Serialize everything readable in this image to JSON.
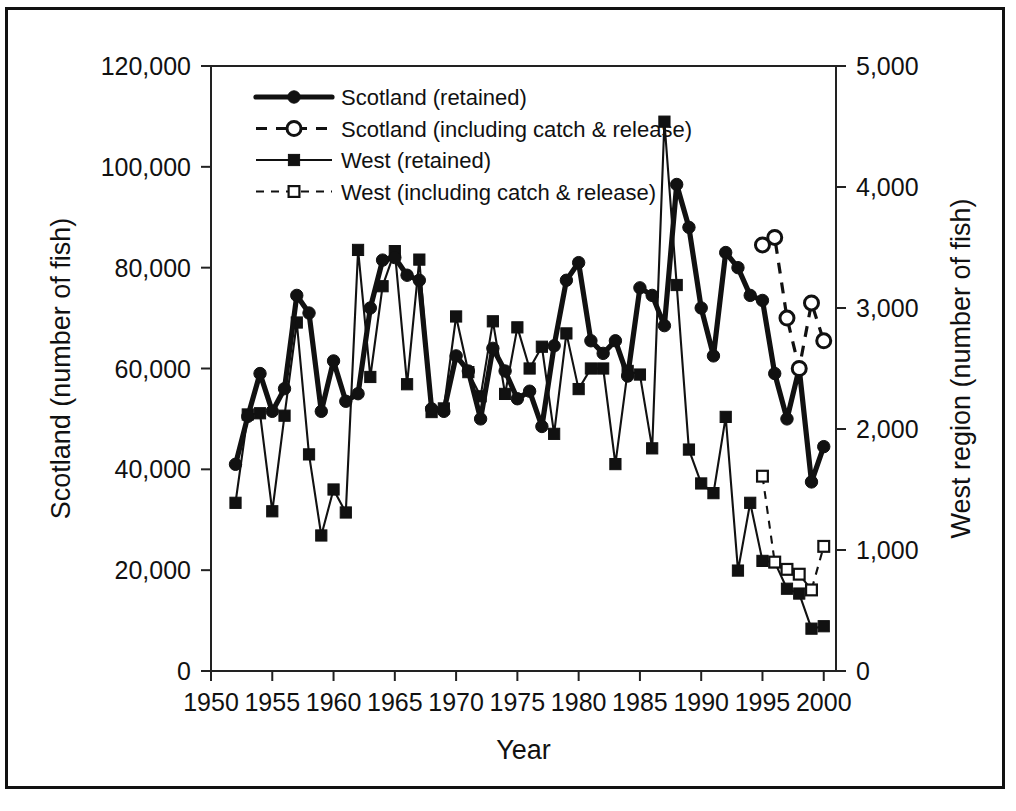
{
  "chart_data": {
    "type": "line",
    "title": "",
    "xlabel": "Year",
    "ylabel": "Scotland (number of fish)",
    "y2label": "West region (number of fish)",
    "xlim": [
      1950,
      2001
    ],
    "ylim": [
      0,
      120000
    ],
    "y2lim": [
      0,
      5000
    ],
    "xticks": [
      1950,
      1955,
      1960,
      1965,
      1970,
      1975,
      1980,
      1985,
      1990,
      1995,
      2000
    ],
    "xtick_labels": [
      "1950",
      "1955",
      "1960",
      "1965",
      "1970",
      "1975",
      "1980",
      "1985",
      "1990",
      "1995",
      "2000"
    ],
    "yticks": [
      0,
      20000,
      40000,
      60000,
      80000,
      100000,
      120000
    ],
    "ytick_labels": [
      "0",
      "20,000",
      "40,000",
      "60,000",
      "80,000",
      "100,000",
      "120,000"
    ],
    "y2ticks": [
      0,
      1000,
      2000,
      3000,
      4000,
      5000
    ],
    "y2tick_labels": [
      "0",
      "1,000",
      "2,000",
      "3,000",
      "4,000",
      "5,000"
    ],
    "grid": false,
    "legend_position": "upper-left-inside",
    "series": [
      {
        "name": "Scotland (retained)",
        "axis": "left",
        "marker": "filled-circle",
        "linestyle": "solid-thick",
        "x": [
          1952,
          1953,
          1954,
          1955,
          1956,
          1957,
          1958,
          1959,
          1960,
          1961,
          1962,
          1963,
          1964,
          1965,
          1966,
          1967,
          1968,
          1969,
          1970,
          1971,
          1972,
          1973,
          1974,
          1975,
          1976,
          1977,
          1978,
          1979,
          1980,
          1981,
          1982,
          1983,
          1984,
          1985,
          1986,
          1987,
          1988,
          1989,
          1990,
          1991,
          1992,
          1993,
          1994,
          1995,
          1996,
          1997,
          1998,
          1999,
          2000
        ],
        "values": [
          41000,
          50500,
          59000,
          51500,
          56000,
          74500,
          71000,
          51500,
          61500,
          53500,
          55000,
          72000,
          81500,
          82000,
          78500,
          77500,
          52000,
          51500,
          62500,
          59500,
          50000,
          64000,
          59500,
          54000,
          55500,
          48500,
          64500,
          77500,
          81000,
          65500,
          63000,
          65500,
          58500,
          76000,
          74500,
          68500,
          96500,
          88000,
          72000,
          62500,
          83000,
          80000,
          74500,
          73500,
          59000,
          50000,
          60000,
          37500,
          44500
        ]
      },
      {
        "name": "Scotland (including catch & release)",
        "axis": "left",
        "marker": "open-circle",
        "linestyle": "dashed",
        "x": [
          1995,
          1996,
          1997,
          1998,
          1999,
          2000
        ],
        "values": [
          84500,
          86000,
          70000,
          60000,
          73000,
          65500
        ]
      },
      {
        "name": "West (retained)",
        "axis": "right",
        "marker": "filled-square",
        "linestyle": "solid-thin",
        "x": [
          1952,
          1953,
          1954,
          1955,
          1956,
          1957,
          1958,
          1959,
          1960,
          1961,
          1962,
          1963,
          1964,
          1965,
          1966,
          1967,
          1968,
          1969,
          1970,
          1971,
          1972,
          1973,
          1974,
          1975,
          1976,
          1977,
          1978,
          1979,
          1980,
          1981,
          1982,
          1983,
          1984,
          1985,
          1986,
          1987,
          1988,
          1989,
          1990,
          1991,
          1992,
          1993,
          1994,
          1995,
          1996,
          1997,
          1998,
          1999,
          2000
        ],
        "values": [
          1390,
          2120,
          2130,
          1320,
          2110,
          2880,
          1790,
          1120,
          1500,
          1310,
          3480,
          2430,
          3180,
          3470,
          2370,
          3400,
          2140,
          2170,
          2930,
          2470,
          2270,
          2890,
          2290,
          2840,
          2500,
          2680,
          1960,
          2790,
          2330,
          2500,
          2500,
          1710,
          2480,
          2450,
          1840,
          4540,
          3190,
          1830,
          1550,
          1470,
          2100,
          830,
          1390,
          910,
          900,
          680,
          640,
          350,
          370
        ]
      },
      {
        "name": "West (including catch & release)",
        "axis": "right",
        "marker": "open-square",
        "linestyle": "dashed",
        "x": [
          1995,
          1996,
          1997,
          1998,
          1999,
          2000
        ],
        "values": [
          1610,
          900,
          840,
          800,
          670,
          1030
        ]
      }
    ]
  },
  "legend": {
    "items": [
      {
        "label": "Scotland (retained)"
      },
      {
        "label": "Scotland (including catch & release)"
      },
      {
        "label": "West (retained)"
      },
      {
        "label": "West (including catch & release)"
      }
    ]
  },
  "colors": {
    "line": "#111111",
    "background": "#ffffff",
    "frame": "#111111"
  }
}
